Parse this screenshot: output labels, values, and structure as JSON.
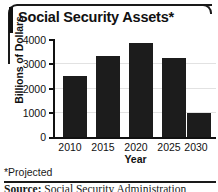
{
  "figure": {
    "title": "Social Security Assets*",
    "footnote": "*Projected",
    "source_label": "Source:",
    "source_text": " Social Security Administration"
  },
  "chart_data": {
    "type": "bar",
    "title": "Social Security Assets*",
    "categories": [
      "2010",
      "2015",
      "2020",
      "2025",
      "2030"
    ],
    "values": [
      2475,
      3300,
      3850,
      3225,
      1000
    ],
    "xlabel": "Year",
    "ylabel": "Billions of Dollars",
    "ylim": [
      0,
      4000
    ],
    "yticks": [
      "0",
      "1000",
      "2000",
      "3000",
      "4000"
    ],
    "ytick_values": [
      0,
      1000,
      2000,
      3000,
      4000
    ],
    "grid": true,
    "legend": "none",
    "bar_color": "#1c1c1c",
    "grid_color": "#e2e2e2",
    "axis_color": "#111111"
  }
}
